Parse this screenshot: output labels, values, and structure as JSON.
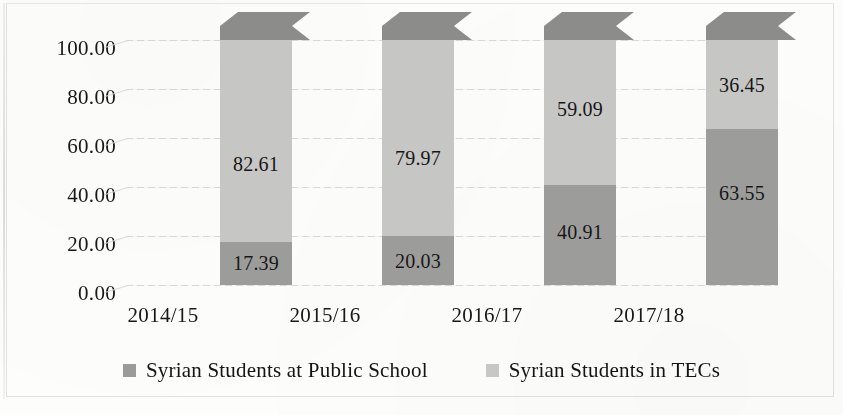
{
  "chart_data": {
    "type": "bar",
    "subtype": "stacked-column-3d",
    "title": "",
    "xlabel": "",
    "ylabel": "",
    "ylim": [
      0,
      100
    ],
    "ytick_step": 20,
    "grid": true,
    "legend_position": "bottom",
    "categories": [
      "2014/15",
      "2015/16",
      "2016/17",
      "2017/18"
    ],
    "ytick_labels": [
      "100.00",
      "80.00",
      "60.00",
      "40.00",
      "20.00",
      "0.00"
    ],
    "series": [
      {
        "name": "Syrian Students at Public School",
        "color": "#9c9c9a",
        "values": [
          17.39,
          20.03,
          40.91,
          63.55
        ],
        "labels": [
          "17.39",
          "20.03",
          "40.91",
          "63.55"
        ]
      },
      {
        "name": "Syrian Students in TECs",
        "color": "#c6c6c4",
        "values": [
          82.61,
          79.97,
          59.09,
          36.45
        ],
        "labels": [
          "82.61",
          "79.97",
          "59.09",
          "36.45"
        ]
      }
    ]
  },
  "legend": {
    "items": [
      {
        "label": "Syrian Students at Public School",
        "swatch": "dark"
      },
      {
        "label": "Syrian Students in TECs",
        "swatch": "light"
      }
    ]
  }
}
